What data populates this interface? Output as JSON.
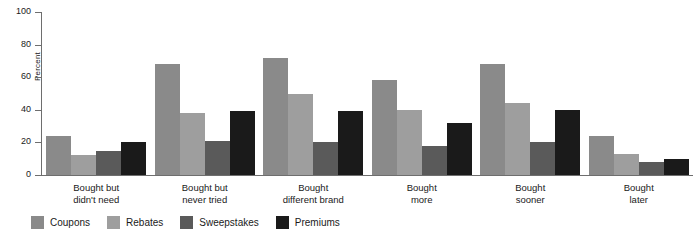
{
  "chart_data": {
    "type": "bar",
    "title": "",
    "xlabel": "",
    "ylabel": "Percent",
    "ylim": [
      0,
      100
    ],
    "yticks": [
      0,
      20,
      40,
      60,
      80,
      100
    ],
    "grid": false,
    "legend_position": "bottom-left",
    "categories": [
      "Bought but\ndidn't need",
      "Bought but\nnever tried",
      "Bought\ndifferent brand",
      "Bought\nmore",
      "Bought\nsooner",
      "Bought\nlater"
    ],
    "category_lines": [
      [
        "Bought but",
        "didn't need"
      ],
      [
        "Bought but",
        "never tried"
      ],
      [
        "Bought",
        "different brand"
      ],
      [
        "Bought",
        "more"
      ],
      [
        "Bought",
        "sooner"
      ],
      [
        "Bought",
        "later"
      ]
    ],
    "series": [
      {
        "name": "Coupons",
        "color": "#8a8a8a",
        "values": [
          24,
          68,
          72,
          58,
          68,
          24
        ]
      },
      {
        "name": "Rebates",
        "color": "#9e9e9e",
        "values": [
          12,
          38,
          50,
          40,
          44,
          13
        ]
      },
      {
        "name": "Sweepstakes",
        "color": "#5a5a5a",
        "values": [
          15,
          21,
          20,
          18,
          20,
          8
        ]
      },
      {
        "name": "Premiums",
        "color": "#1a1a1a",
        "values": [
          20,
          39,
          39,
          32,
          40,
          10
        ]
      }
    ]
  },
  "axis": {
    "y_label": "Percent",
    "tick_labels": [
      "100",
      "80",
      "60",
      "40",
      "20",
      "0"
    ],
    "axis_color": "#6e6e6e"
  },
  "legend": {
    "items": [
      {
        "label": "Coupons",
        "color": "#8a8a8a"
      },
      {
        "label": "Rebates",
        "color": "#9e9e9e"
      },
      {
        "label": "Sweepstakes",
        "color": "#5a5a5a"
      },
      {
        "label": "Premiums",
        "color": "#1a1a1a"
      }
    ]
  }
}
